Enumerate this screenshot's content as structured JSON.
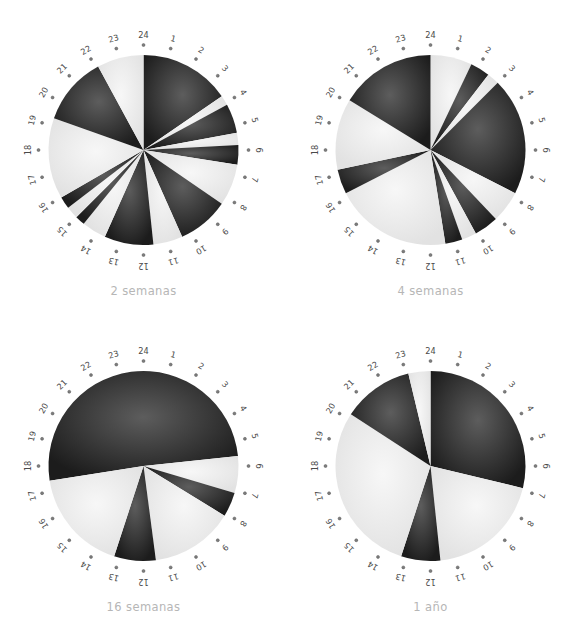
{
  "figure": {
    "title": "",
    "background_color": "#ffffff",
    "panel_count": 4,
    "layout": "2x2"
  },
  "style": {
    "dark_color": "#1c1c1c",
    "light_color": "#e2e2e2",
    "dark_highlight": "#5d5d5d",
    "light_highlight": "#f7f7f7",
    "caption_color": "#b6b6b6",
    "tick_label_color": "#4a4a4a",
    "tick_dot_color": "#7d7d7d"
  },
  "tick_labels": [
    "1",
    "2",
    "3",
    "4",
    "5",
    "6",
    "7",
    "8",
    "9",
    "10",
    "11",
    "12",
    "13",
    "14",
    "15",
    "16",
    "17",
    "18",
    "19",
    "20",
    "21",
    "22",
    "23",
    "24"
  ],
  "chart_data": [
    {
      "type": "pie",
      "title": "2 semanas",
      "panel": "top-left",
      "units": "hours (24-hour clock)",
      "axis_labels": [
        "1",
        "2",
        "3",
        "4",
        "5",
        "6",
        "7",
        "8",
        "9",
        "10",
        "11",
        "12",
        "13",
        "14",
        "15",
        "16",
        "17",
        "18",
        "19",
        "20",
        "21",
        "22",
        "23",
        "24"
      ],
      "categories": [
        "activo",
        "reposo"
      ],
      "legend": [],
      "grid": false,
      "start_hour": 24,
      "direction": "clockwise",
      "segments": [
        {
          "start_hour": 24.0,
          "end_hour": 3.7,
          "state": "activo"
        },
        {
          "start_hour": 3.7,
          "end_hour": 4.1,
          "state": "reposo"
        },
        {
          "start_hour": 4.1,
          "end_hour": 5.3,
          "state": "activo"
        },
        {
          "start_hour": 5.3,
          "end_hour": 5.8,
          "state": "reposo"
        },
        {
          "start_hour": 5.8,
          "end_hour": 6.6,
          "state": "activo"
        },
        {
          "start_hour": 6.6,
          "end_hour": 8.3,
          "state": "reposo"
        },
        {
          "start_hour": 8.3,
          "end_hour": 10.4,
          "state": "activo"
        },
        {
          "start_hour": 10.4,
          "end_hour": 11.6,
          "state": "reposo"
        },
        {
          "start_hour": 11.6,
          "end_hour": 13.6,
          "state": "activo"
        },
        {
          "start_hour": 13.6,
          "end_hour": 14.6,
          "state": "reposo"
        },
        {
          "start_hour": 14.6,
          "end_hour": 15.0,
          "state": "activo"
        },
        {
          "start_hour": 15.0,
          "end_hour": 15.5,
          "state": "reposo"
        },
        {
          "start_hour": 15.5,
          "end_hour": 16.0,
          "state": "activo"
        },
        {
          "start_hour": 16.0,
          "end_hour": 19.3,
          "state": "reposo"
        },
        {
          "start_hour": 19.3,
          "end_hour": 22.1,
          "state": "activo"
        },
        {
          "start_hour": 22.1,
          "end_hour": 24.0,
          "state": "reposo"
        }
      ]
    },
    {
      "type": "pie",
      "title": "4 semanas",
      "panel": "top-right",
      "units": "hours (24-hour clock)",
      "axis_labels": [
        "1",
        "2",
        "3",
        "4",
        "5",
        "6",
        "7",
        "8",
        "9",
        "10",
        "11",
        "12",
        "13",
        "14",
        "15",
        "16",
        "17",
        "18",
        "19",
        "20",
        "21",
        "22",
        "23",
        "24"
      ],
      "categories": [
        "activo",
        "reposo"
      ],
      "legend": [],
      "grid": false,
      "start_hour": 24,
      "direction": "clockwise",
      "segments": [
        {
          "start_hour": 24.0,
          "end_hour": 1.7,
          "state": "reposo"
        },
        {
          "start_hour": 1.7,
          "end_hour": 2.5,
          "state": "activo"
        },
        {
          "start_hour": 2.5,
          "end_hour": 3.0,
          "state": "reposo"
        },
        {
          "start_hour": 3.0,
          "end_hour": 7.8,
          "state": "activo"
        },
        {
          "start_hour": 7.8,
          "end_hour": 9.1,
          "state": "reposo"
        },
        {
          "start_hour": 9.1,
          "end_hour": 10.1,
          "state": "activo"
        },
        {
          "start_hour": 10.1,
          "end_hour": 10.7,
          "state": "reposo"
        },
        {
          "start_hour": 10.7,
          "end_hour": 11.4,
          "state": "activo"
        },
        {
          "start_hour": 11.4,
          "end_hour": 16.2,
          "state": "reposo"
        },
        {
          "start_hour": 16.2,
          "end_hour": 17.2,
          "state": "activo"
        },
        {
          "start_hour": 17.2,
          "end_hour": 20.1,
          "state": "reposo"
        },
        {
          "start_hour": 20.1,
          "end_hour": 24.0,
          "state": "activo"
        }
      ]
    },
    {
      "type": "pie",
      "title": "16 semanas",
      "panel": "bottom-left",
      "units": "hours (24-hour clock)",
      "axis_labels": [
        "1",
        "2",
        "3",
        "4",
        "5",
        "6",
        "7",
        "8",
        "9",
        "10",
        "11",
        "12",
        "13",
        "14",
        "15",
        "16",
        "17",
        "18",
        "19",
        "20",
        "21",
        "22",
        "23",
        "24"
      ],
      "categories": [
        "activo",
        "reposo"
      ],
      "legend": [],
      "grid": false,
      "start_hour": 24,
      "direction": "clockwise",
      "segments": [
        {
          "start_hour": 17.4,
          "end_hour": 5.6,
          "state": "activo"
        },
        {
          "start_hour": 5.6,
          "end_hour": 7.1,
          "state": "reposo"
        },
        {
          "start_hour": 7.1,
          "end_hour": 8.1,
          "state": "activo"
        },
        {
          "start_hour": 8.1,
          "end_hour": 11.5,
          "state": "reposo"
        },
        {
          "start_hour": 11.5,
          "end_hour": 13.2,
          "state": "activo"
        },
        {
          "start_hour": 13.2,
          "end_hour": 17.4,
          "state": "reposo"
        }
      ]
    },
    {
      "type": "pie",
      "title": "1 año",
      "panel": "bottom-right",
      "units": "hours (24-hour clock)",
      "axis_labels": [
        "1",
        "2",
        "3",
        "4",
        "5",
        "6",
        "7",
        "8",
        "9",
        "10",
        "11",
        "12",
        "13",
        "14",
        "15",
        "16",
        "17",
        "18",
        "19",
        "20",
        "21",
        "22",
        "23",
        "24"
      ],
      "categories": [
        "activo",
        "reposo"
      ],
      "legend": [],
      "grid": false,
      "start_hour": 24,
      "direction": "clockwise",
      "segments": [
        {
          "start_hour": 24.0,
          "end_hour": 6.9,
          "state": "activo"
        },
        {
          "start_hour": 6.9,
          "end_hour": 11.6,
          "state": "reposo"
        },
        {
          "start_hour": 11.6,
          "end_hour": 13.2,
          "state": "activo"
        },
        {
          "start_hour": 13.2,
          "end_hour": 20.2,
          "state": "reposo"
        },
        {
          "start_hour": 20.2,
          "end_hour": 23.1,
          "state": "activo"
        },
        {
          "start_hour": 23.1,
          "end_hour": 24.0,
          "state": "reposo"
        }
      ]
    }
  ]
}
